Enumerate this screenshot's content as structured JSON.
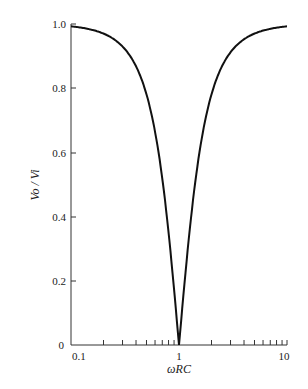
{
  "chart_data": {
    "type": "line",
    "title": "",
    "xlabel": "ωRC",
    "ylabel": "Vo / Vi",
    "xscale": "log",
    "xlim": [
      0.1,
      10
    ],
    "ylim": [
      0,
      1.0
    ],
    "x_ticks": [
      "0.1",
      "1",
      "10"
    ],
    "y_ticks": [
      "0",
      "0.2",
      "0.4",
      "0.6",
      "0.8",
      "1.0"
    ],
    "grid": false,
    "series": [
      {
        "name": "Vo/Vi",
        "x": [
          0.1,
          0.2,
          0.3,
          0.5,
          0.7,
          1.0,
          1.5,
          2,
          3,
          5,
          10
        ],
        "y": [
          0.93,
          0.82,
          0.7,
          0.47,
          0.26,
          0.0,
          0.29,
          0.45,
          0.62,
          0.79,
          0.92
        ]
      }
    ]
  }
}
